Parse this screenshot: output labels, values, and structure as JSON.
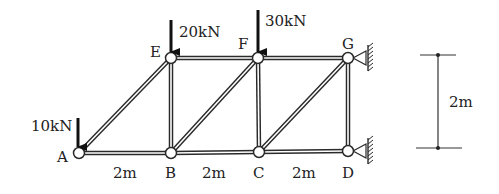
{
  "diagram": {
    "type": "truss",
    "nodes": [
      {
        "id": "A",
        "label": "A",
        "x": 79,
        "y": 153
      },
      {
        "id": "B",
        "label": "B",
        "x": 171,
        "y": 153
      },
      {
        "id": "C",
        "label": "C",
        "x": 259,
        "y": 152
      },
      {
        "id": "D",
        "label": "D",
        "x": 348,
        "y": 151
      },
      {
        "id": "E",
        "label": "E",
        "x": 171,
        "y": 58
      },
      {
        "id": "F",
        "label": "F",
        "x": 258,
        "y": 58
      },
      {
        "id": "G",
        "label": "G",
        "x": 348,
        "y": 58
      }
    ],
    "members": [
      [
        "A",
        "B"
      ],
      [
        "B",
        "C"
      ],
      [
        "C",
        "D"
      ],
      [
        "E",
        "F"
      ],
      [
        "F",
        "G"
      ],
      [
        "A",
        "E"
      ],
      [
        "B",
        "E"
      ],
      [
        "B",
        "F"
      ],
      [
        "C",
        "F"
      ],
      [
        "C",
        "G"
      ],
      [
        "D",
        "G"
      ]
    ],
    "loads": [
      {
        "node": "A",
        "label": "10kN"
      },
      {
        "node": "E",
        "label": "20kN"
      },
      {
        "node": "F",
        "label": "30kN"
      }
    ],
    "supports": [
      {
        "node": "G",
        "type": "pin-wall-right"
      },
      {
        "node": "D",
        "type": "pin-wall-right"
      }
    ],
    "span_dimensions": [
      "2m",
      "2m",
      "2m"
    ],
    "height_dimension": "2m",
    "colors": {
      "line": "#2a2a2a",
      "node_fill": "#ffffff",
      "background": "#ffffff"
    }
  }
}
